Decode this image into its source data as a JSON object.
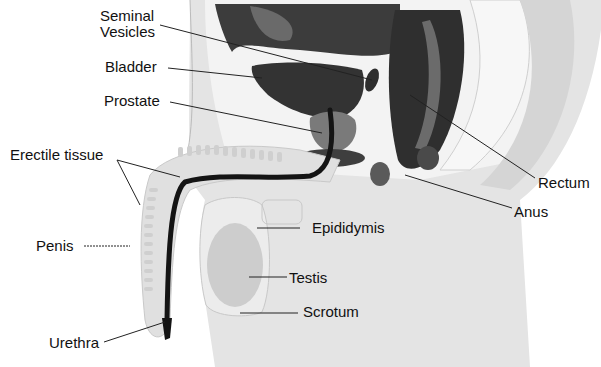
{
  "diagram": {
    "type": "anatomical cross-section",
    "colors": {
      "background": "#ffffff",
      "body_fill": "#e6e6e6",
      "pale_fill": "#f2f2f2",
      "dark_organ": "#3a3a3a",
      "mid_organ": "#6e6e6e",
      "urethra": "#151515",
      "testis": "#cfcfcf",
      "leader_line": "#222222"
    },
    "labels": {
      "seminal_vesicles_1": "Seminal",
      "seminal_vesicles_2": "Vesicles",
      "bladder": "Bladder",
      "prostate": "Prostate",
      "erectile_tissue": "Erectile tissue",
      "penis": "Penis",
      "urethra": "Urethra",
      "epididymis": "Epididymis",
      "testis": "Testis",
      "scrotum": "Scrotum",
      "rectum": "Rectum",
      "anus": "Anus"
    }
  }
}
